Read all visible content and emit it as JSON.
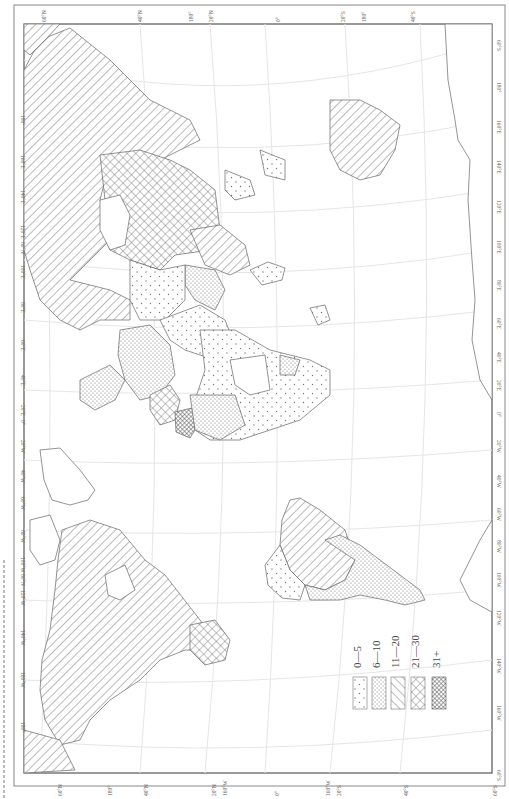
{
  "figure": {
    "orientation": "rotated-90-clockwise",
    "caption_visible": false
  },
  "map": {
    "title": "",
    "frame_color": "#555555",
    "graticule_color": "#e6e6e6",
    "coast_color": "#666666",
    "pattern_color": "#777777",
    "top_labels": [
      "60°N",
      "40°N",
      "180°",
      "20°N",
      "0°",
      "20°S",
      "180°",
      "40°S"
    ],
    "bottom_labels": [
      "60°N",
      "180°",
      "40°N",
      "20°N",
      "160°W",
      "0°",
      "160°W",
      "20°S",
      "40°S",
      "60°S"
    ],
    "left_labels": [
      "180°",
      "160°E",
      "140°E",
      "120°E",
      "80°N",
      "100°E",
      "80°E",
      "60°E",
      "40°E",
      "20°E",
      "0°",
      "20°W",
      "40°W",
      "60°W",
      "80°W",
      "100°W",
      "80°N",
      "120°W",
      "140°W",
      "160°W",
      "180°"
    ],
    "right_labels": [
      "60°S",
      "180°",
      "160°E",
      "140°E",
      "120°E",
      "100°E",
      "80°E",
      "60°E",
      "40°E",
      "20°E",
      "0°",
      "20°W",
      "40°W",
      "60°W",
      "80°W",
      "100°W",
      "120°W",
      "140°W",
      "160°W",
      "60°S"
    ]
  },
  "legend": {
    "items": [
      {
        "label": "0—5",
        "pattern": "sparse-dots"
      },
      {
        "label": "6—10",
        "pattern": "dense-dots"
      },
      {
        "label": "11—20",
        "pattern": "diagonal-hatch"
      },
      {
        "label": "21—30",
        "pattern": "cross-hatch"
      },
      {
        "label": "31+",
        "pattern": "dark-dense"
      }
    ]
  },
  "regions": [
    {
      "name": "Russia",
      "class": "11—20"
    },
    {
      "name": "China",
      "class": "21—30"
    },
    {
      "name": "Southeast Asia",
      "class": "11—20"
    },
    {
      "name": "India",
      "class": "6—10"
    },
    {
      "name": "Middle East",
      "class": "0—5"
    },
    {
      "name": "Europe",
      "class": "6—10"
    },
    {
      "name": "Eastern Europe",
      "class": "21—30"
    },
    {
      "name": "Western Europe",
      "class": "31+"
    },
    {
      "name": "Africa",
      "class": "0—5"
    },
    {
      "name": "Australia",
      "class": "11—20"
    },
    {
      "name": "North America",
      "class": "11—20"
    },
    {
      "name": "Central America",
      "class": "21—30"
    },
    {
      "name": "South America North",
      "class": "11—20"
    },
    {
      "name": "South America South",
      "class": "6—10"
    },
    {
      "name": "Greenland",
      "class": "none"
    },
    {
      "name": "Antarctica",
      "class": "none"
    }
  ]
}
